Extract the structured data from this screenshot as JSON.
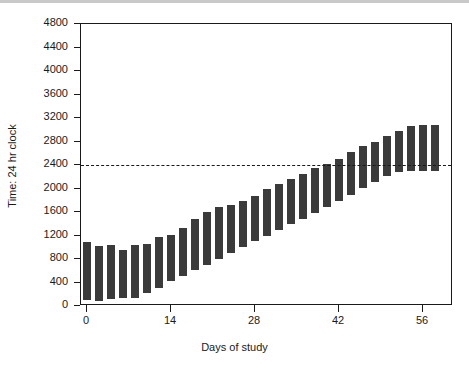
{
  "chart_data": {
    "type": "bar",
    "title": "",
    "subtitle": "",
    "xlabel": "Days of study",
    "ylabel": "Time: 24 hr clock",
    "xlim": [
      -1,
      61
    ],
    "ylim": [
      0,
      4800
    ],
    "xticks": [
      0,
      14,
      28,
      42,
      56
    ],
    "yticks": [
      0,
      400,
      800,
      1200,
      1600,
      2000,
      2400,
      2800,
      3200,
      3600,
      4000,
      4400,
      4800
    ],
    "grid": false,
    "legend": null,
    "bar_color": "#3b3b3b",
    "frame_color": "#1a1a1a",
    "annotations": [
      {
        "name": "reference-line",
        "type": "hline",
        "value": 2400,
        "style": "dashed",
        "color": "#1a1a1a"
      }
    ],
    "note": "Floating bars: each bar spans from sleep onset (bottom) to sleep offset (top) on a 24 hr clock; bars drift progressively later across days of study.",
    "series": [
      {
        "name": "Sleep episode",
        "encoding": "floating-bar",
        "x": [
          0,
          2,
          4,
          6,
          8,
          10,
          12,
          14,
          16,
          18,
          20,
          22,
          24,
          26,
          28,
          30,
          32,
          34,
          36,
          38,
          40,
          42,
          44,
          46,
          48,
          50,
          52,
          54,
          56,
          58
        ],
        "bottom": [
          110,
          90,
          120,
          140,
          135,
          215,
          310,
          420,
          515,
          605,
          700,
          805,
          910,
          1005,
          1100,
          1195,
          1290,
          1390,
          1480,
          1575,
          1690,
          1790,
          1895,
          2000,
          2105,
          2215,
          2280,
          2295,
          2300,
          2305
        ],
        "top": [
          1095,
          1020,
          1045,
          960,
          1030,
          1060,
          1170,
          1205,
          1320,
          1475,
          1595,
          1690,
          1715,
          1790,
          1880,
          1990,
          2085,
          2160,
          2245,
          2345,
          2420,
          2500,
          2625,
          2720,
          2800,
          2890,
          2985,
          3060,
          3075,
          3080
        ]
      }
    ]
  },
  "axis_titles": {
    "x": "Days of study",
    "y": "Time: 24 hr clock"
  }
}
